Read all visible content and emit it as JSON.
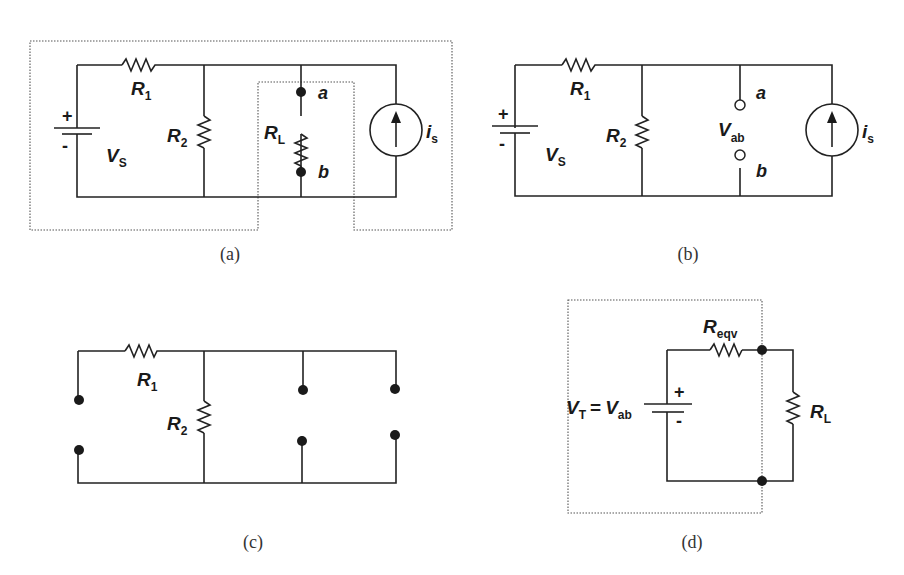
{
  "panels": {
    "a": {
      "caption": "(a)",
      "labels": {
        "r1": "R",
        "r1_sub": "1",
        "r2": "R",
        "r2_sub": "2",
        "rl": "R",
        "rl_sub": "L",
        "vs": "V",
        "vs_sub": "S",
        "is": "i",
        "is_sub": "s",
        "a": "a",
        "b": "b",
        "plus": "+",
        "minus": "-"
      }
    },
    "b": {
      "caption": "(b)",
      "labels": {
        "r1": "R",
        "r1_sub": "1",
        "r2": "R",
        "r2_sub": "2",
        "vab": "V",
        "vab_sub": "ab",
        "vs": "V",
        "vs_sub": "S",
        "is": "i",
        "is_sub": "s",
        "a": "a",
        "b": "b",
        "plus": "+",
        "minus": "-"
      }
    },
    "c": {
      "caption": "(c)",
      "labels": {
        "r1": "R",
        "r1_sub": "1",
        "r2": "R",
        "r2_sub": "2"
      }
    },
    "d": {
      "caption": "(d)",
      "labels": {
        "vt": "V",
        "vt_sub": "T",
        "eq": "=",
        "vab": "V",
        "vab_sub": "ab",
        "reqv": "R",
        "reqv_sub": "eqv",
        "rl": "R",
        "rl_sub": "L",
        "plus": "+",
        "minus": "-"
      }
    }
  },
  "colors": {
    "wire": "#222222",
    "dotted_box": "#555555",
    "background": "#ffffff"
  }
}
